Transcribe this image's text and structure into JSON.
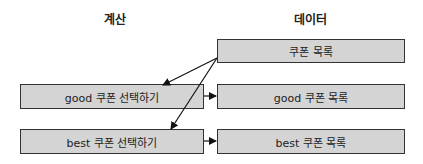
{
  "headers": {
    "compute": "계산",
    "data": "데이터"
  },
  "data_boxes": {
    "coupon_list": "쿠폰 목록",
    "good_coupon_list": "good 쿠폰 목록",
    "best_coupon_list": "best 쿠폰 목록"
  },
  "compute_boxes": {
    "select_good": "good 쿠폰 선택하기",
    "select_best": "best 쿠폰 선택하기"
  },
  "colors": {
    "box_fill": "#d4d4d4",
    "border": "#333333"
  }
}
